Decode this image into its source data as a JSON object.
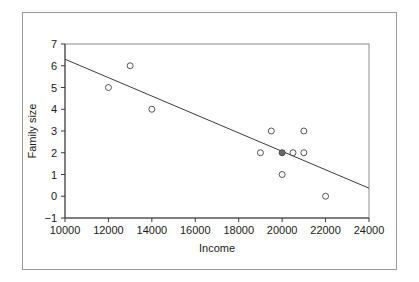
{
  "chart_data": {
    "type": "scatter",
    "title": "",
    "xlabel": "Income",
    "ylabel": "Family size",
    "xlim": [
      10000,
      24000
    ],
    "ylim": [
      -1,
      7
    ],
    "xticks": [
      10000,
      12000,
      14000,
      16000,
      18000,
      20000,
      22000,
      24000
    ],
    "yticks": [
      -1,
      0,
      1,
      2,
      3,
      4,
      5,
      6,
      7
    ],
    "xtick_labels": [
      "10000",
      "12000",
      "14000",
      "16000",
      "18000",
      "20000",
      "22000",
      "24000"
    ],
    "ytick_labels": [
      "-1",
      "0",
      "1",
      "2",
      "3",
      "4",
      "5",
      "6",
      "7"
    ],
    "grid": false,
    "legend": false,
    "marker_style": "open-circle",
    "points": [
      {
        "x": 12000,
        "y": 5,
        "overlap": false
      },
      {
        "x": 13000,
        "y": 6,
        "overlap": false
      },
      {
        "x": 14000,
        "y": 4,
        "overlap": false
      },
      {
        "x": 19000,
        "y": 2,
        "overlap": false
      },
      {
        "x": 19500,
        "y": 3,
        "overlap": false
      },
      {
        "x": 20000,
        "y": 2,
        "overlap": true
      },
      {
        "x": 20000,
        "y": 1,
        "overlap": false
      },
      {
        "x": 20500,
        "y": 2,
        "overlap": false
      },
      {
        "x": 21000,
        "y": 3,
        "overlap": false
      },
      {
        "x": 21000,
        "y": 2,
        "overlap": false
      },
      {
        "x": 22000,
        "y": 0,
        "overlap": false
      }
    ],
    "trend_line": {
      "x_start": 10000,
      "y_start": 6.3,
      "x_end": 24000,
      "y_end": 0.37
    }
  }
}
